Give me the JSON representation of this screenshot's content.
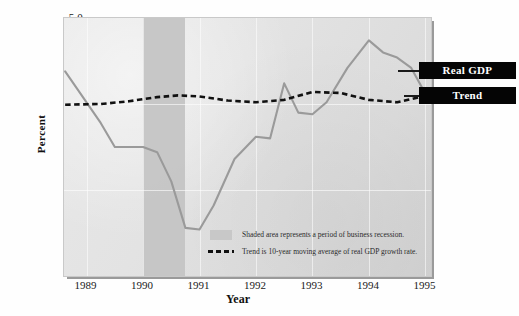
{
  "figure": {
    "y_axis_title": "Percent",
    "x_axis_title": "Year"
  },
  "callouts": {
    "real_gdp_label": "Real GDP",
    "trend_label": "Trend"
  },
  "legend": {
    "recession_note": "Shaded area represents a period of business recession.",
    "trend_note": "Trend is 10-year moving average of real GDP growth rate."
  },
  "colors": {
    "real_gdp_line": "#9a9a9a",
    "trend_line": "#111111",
    "recession_band": "#c3c3c3",
    "plot_background": "#e3e3e3",
    "callout_background": "#050505",
    "callout_text": "#ffffff"
  },
  "chart_data": {
    "type": "line",
    "title": "",
    "xlabel": "Year",
    "ylabel": "Percent",
    "xlim": [
      1988.6,
      1995.1
    ],
    "ylim": [
      -2.5,
      5.0
    ],
    "yticks": [
      -2.5,
      0.0,
      2.5,
      5.0
    ],
    "ytick_labels": [
      "-2.5",
      "0.0",
      "2.5",
      "5.0"
    ],
    "xticks": [
      1989,
      1990,
      1991,
      1992,
      1993,
      1994,
      1995
    ],
    "xtick_labels": [
      "1989",
      "1990",
      "1991",
      "1992",
      "1993",
      "1994",
      "1995"
    ],
    "grid": true,
    "legend_position": "inside-lower-right",
    "shaded_regions": [
      {
        "label": "business recession",
        "x_start": 1990.0,
        "x_end": 1990.75
      }
    ],
    "series": [
      {
        "name": "Real GDP",
        "color": "#9a9a9a",
        "style": "solid",
        "x": [
          1988.62,
          1989.25,
          1989.5,
          1990.0,
          1990.25,
          1990.5,
          1990.75,
          1991.0,
          1991.25,
          1991.62,
          1992.0,
          1992.25,
          1992.5,
          1992.75,
          1993.0,
          1993.25,
          1993.62,
          1994.0,
          1994.25,
          1994.5,
          1994.75,
          1994.95
        ],
        "y": [
          3.45,
          1.95,
          1.25,
          1.25,
          1.1,
          0.25,
          -1.1,
          -1.15,
          -0.45,
          0.9,
          1.55,
          1.5,
          3.1,
          2.25,
          2.2,
          2.55,
          3.55,
          4.35,
          4.0,
          3.85,
          3.55,
          2.95
        ]
      },
      {
        "name": "Trend",
        "color": "#111111",
        "style": "dashed",
        "x": [
          1988.62,
          1989.25,
          1989.75,
          1990.25,
          1990.62,
          1991.0,
          1991.5,
          1992.0,
          1992.5,
          1993.0,
          1993.5,
          1994.0,
          1994.5,
          1994.95
        ],
        "y": [
          2.48,
          2.5,
          2.58,
          2.7,
          2.75,
          2.72,
          2.6,
          2.55,
          2.62,
          2.85,
          2.82,
          2.62,
          2.55,
          2.72
        ]
      }
    ]
  }
}
